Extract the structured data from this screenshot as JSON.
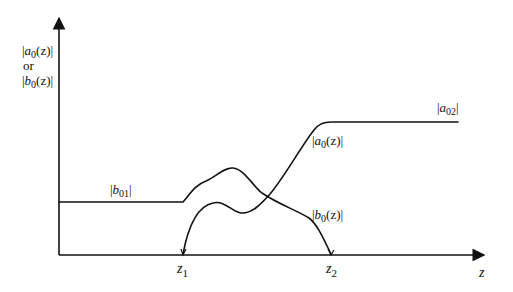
{
  "diagram": {
    "y_axis_label": {
      "line1_prefix": "|",
      "line1_var": "a",
      "line1_sub": "0",
      "line1_rest": "(z)|",
      "line2": "or",
      "line3_prefix": "|",
      "line3_var": "b",
      "line3_sub": "0",
      "line3_rest": "(z)|"
    },
    "x_axis_label": "z",
    "ticks": [
      {
        "var": "z",
        "sub": "1"
      },
      {
        "var": "z",
        "sub": "2"
      }
    ],
    "curve_labels": {
      "b01": {
        "prefix": "|",
        "var": "b",
        "sub": "01",
        "suffix": "|"
      },
      "a02": {
        "prefix": "|",
        "var": "a",
        "sub": "02",
        "suffix": "|"
      },
      "a0z": {
        "prefix": "|",
        "var": "a",
        "sub": "0",
        "suffix": "(z)|"
      },
      "b0z": {
        "prefix": "|",
        "var": "b",
        "sub": "0",
        "suffix": "(z)|"
      }
    },
    "colors": {
      "stroke": "#111111",
      "background": "#ffffff"
    }
  }
}
